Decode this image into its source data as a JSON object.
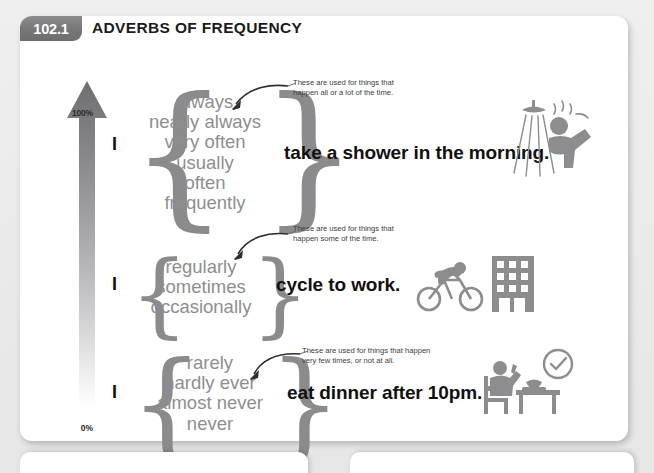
{
  "page": {
    "background_color": "#ececed",
    "card_color": "#ffffff"
  },
  "header": {
    "badge": "102.1",
    "title": "ADVERBS OF FREQUENCY",
    "badge_color": "#76767a",
    "title_color": "#1b1b1b"
  },
  "frequency_scale": {
    "top_label": "100%",
    "bottom_label": "0%",
    "gradient_from": "#6f6f71",
    "gradient_to": "#ffffff",
    "icon": "up-arrow-gradient"
  },
  "rows": [
    {
      "id": "high-frequency",
      "subject": "I",
      "adverbs": [
        "always",
        "nearly always",
        "very often",
        "usually",
        "often",
        "frequently"
      ],
      "predicate": "take a shower in the morning.",
      "note": [
        "These are used for things that",
        "happen all or a lot of the time."
      ],
      "icons": [
        "shower-icon"
      ]
    },
    {
      "id": "mid-frequency",
      "subject": "I",
      "adverbs": [
        "regularly",
        "sometimes",
        "occasionally"
      ],
      "predicate": "cycle to work.",
      "note": [
        "These are used for things that",
        "happen some of the time."
      ],
      "icons": [
        "cyclist-icon",
        "office-building-icon"
      ]
    },
    {
      "id": "low-frequency",
      "subject": "I",
      "adverbs": [
        "rarely",
        "hardly ever",
        "almost never",
        "never"
      ],
      "predicate": "eat dinner after 10pm.",
      "note": [
        "These are used for things that happen",
        "very few times, or not at all."
      ],
      "icons": [
        "person-eating-icon",
        "clock-check-icon"
      ]
    }
  ],
  "bottom_panels": [
    {
      "id": "bottom-left-panel"
    },
    {
      "id": "bottom-right-panel"
    }
  ]
}
